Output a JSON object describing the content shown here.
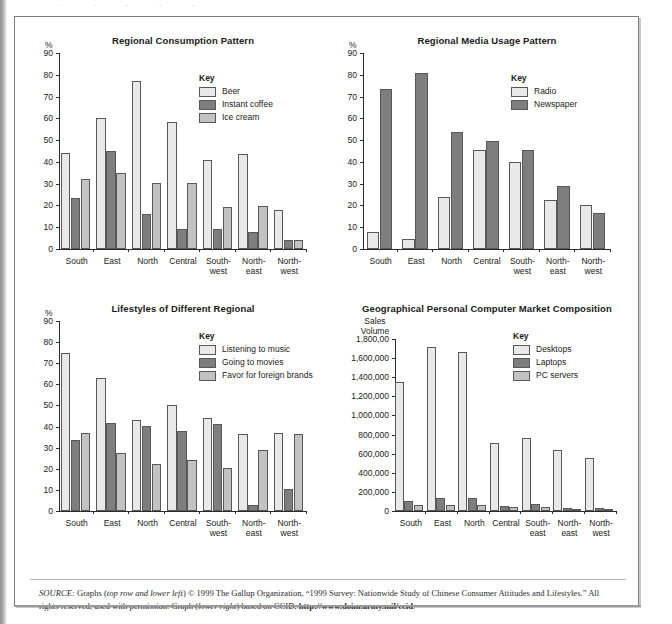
{
  "colors": {
    "series_light": "#e9e9e9",
    "series_dark": "#7e7e7e",
    "series_medium": "#c2c2c2",
    "outline": "#585858",
    "axis": "#2b2b2b",
    "frame": "#7d7d7d"
  },
  "key_title": "Key",
  "source_note": {
    "label": "SOURCE:",
    "part1": " Graphs (",
    "em1": "top row and lower left",
    "part2": ") © 1999 The Gallup Organization, “1999 Survey: Nationwide Study of Chinese Consumer Attitudes and Lifestyles.” All rights reserved, used with permission. Graph (",
    "em2": "lower right",
    "part3": ") based on CCID, ",
    "url": "http://www.doim.army.mil/ccid",
    "part4": "."
  },
  "chart_data": [
    {
      "id": "regional-consumption-pattern",
      "type": "bar",
      "title": "Regional Consumption Pattern",
      "position": "top-left",
      "ylabel": "%",
      "xlabel": "",
      "ylim": [
        0,
        90
      ],
      "yticks": [
        0,
        10,
        20,
        30,
        40,
        50,
        60,
        70,
        80,
        90
      ],
      "ytick_labels": [
        "0",
        "10",
        "20",
        "30",
        "40",
        "50",
        "60",
        "70",
        "80",
        "90"
      ],
      "grid": false,
      "legend_position": "inside-top-right",
      "categories": [
        "South",
        "East",
        "North",
        "Central",
        "South-west",
        "Northeast",
        "North-west"
      ],
      "category_lines": [
        [
          "South"
        ],
        [
          "East"
        ],
        [
          "North"
        ],
        [
          "Central"
        ],
        [
          "South-",
          "west"
        ],
        [
          "North-",
          "east"
        ],
        [
          "North-",
          "west"
        ]
      ],
      "series": [
        {
          "name": "Beer",
          "color": "#e9e9e9",
          "values": [
            44,
            60,
            77,
            58.5,
            41,
            43.5,
            18
          ]
        },
        {
          "name": "Instant coffee",
          "color": "#7e7e7e",
          "values": [
            23.5,
            44.8,
            16,
            9.3,
            9.2,
            7.8,
            4
          ]
        },
        {
          "name": "Ice cream",
          "color": "#c2c2c2",
          "values": [
            32,
            34.8,
            30.2,
            30.1,
            19.2,
            19.6,
            4.1
          ]
        }
      ]
    },
    {
      "id": "regional-media-usage-pattern",
      "type": "bar",
      "title": "Regional Media Usage Pattern",
      "position": "top-right",
      "ylabel": "%",
      "xlabel": "",
      "ylim": [
        0,
        90
      ],
      "yticks": [
        0,
        10,
        20,
        30,
        40,
        50,
        60,
        70,
        80,
        90
      ],
      "ytick_labels": [
        "0",
        "10",
        "20",
        "30",
        "40",
        "50",
        "60",
        "70",
        "80",
        "90"
      ],
      "grid": false,
      "legend_position": "inside-top-right",
      "categories": [
        "South",
        "East",
        "North",
        "Central",
        "Southwest",
        "Northeast",
        "Northwest"
      ],
      "category_lines": [
        [
          "South"
        ],
        [
          "East"
        ],
        [
          "North"
        ],
        [
          "Central"
        ],
        [
          "South-",
          "west"
        ],
        [
          "North-",
          "east"
        ],
        [
          "North-",
          "west"
        ]
      ],
      "series": [
        {
          "name": "Radio",
          "color": "#e9e9e9",
          "values": [
            7.9,
            4.6,
            24,
            45.5,
            39.8,
            22.5,
            20
          ]
        },
        {
          "name": "Newspaper",
          "color": "#7e7e7e",
          "values": [
            73.5,
            80.6,
            53.8,
            49.8,
            45.3,
            28.9,
            16.6
          ]
        }
      ]
    },
    {
      "id": "lifestyles-of-different-regional",
      "type": "bar",
      "title": "Lifestyles of Different Regional",
      "position": "bottom-left",
      "ylabel": "%",
      "xlabel": "",
      "ylim": [
        0,
        90
      ],
      "yticks": [
        0,
        10,
        20,
        30,
        40,
        50,
        60,
        70,
        80,
        90
      ],
      "ytick_labels": [
        "0",
        "10",
        "20",
        "30",
        "40",
        "50",
        "60",
        "70",
        "80",
        "90"
      ],
      "grid": false,
      "legend_position": "inside-top-right",
      "categories": [
        "South",
        "East",
        "North",
        "Central",
        "Southwest",
        "Northeast",
        "Northwest"
      ],
      "category_lines": [
        [
          "South"
        ],
        [
          "East"
        ],
        [
          "North"
        ],
        [
          "Central"
        ],
        [
          "South-",
          "west"
        ],
        [
          "North-",
          "east"
        ],
        [
          "North-",
          "west"
        ]
      ],
      "series": [
        {
          "name": "Listening to music",
          "color": "#e9e9e9",
          "values": [
            75,
            63.2,
            43,
            50.3,
            44,
            36.4,
            37
          ]
        },
        {
          "name": "Going to movies",
          "color": "#7e7e7e",
          "values": [
            33.6,
            41.5,
            40.4,
            37.7,
            41.2,
            2.7,
            10.4
          ]
        },
        {
          "name": "Favor for foreign brands",
          "color": "#c2c2c2",
          "values": [
            36.8,
            27.7,
            22.5,
            24.3,
            20.3,
            29,
            36.5
          ]
        }
      ]
    },
    {
      "id": "geographical-pc-market-composition",
      "type": "bar",
      "title": "Geographical Personal Computer Market Composition",
      "position": "bottom-right",
      "ylabel": "Sales Volume",
      "ylabel_lines": [
        "Sales",
        "Volume"
      ],
      "xlabel": "",
      "ylim": [
        0,
        1800000
      ],
      "yticks": [
        0,
        200000,
        400000,
        600000,
        800000,
        1000000,
        1200000,
        1400000,
        1600000,
        1800000
      ],
      "ytick_labels": [
        "0",
        "200,000",
        "400,000",
        "600,000",
        "800,000",
        "1,000,000",
        "1,200,000",
        "1,400,000",
        "1,600,000",
        "1,800,00"
      ],
      "grid": false,
      "legend_position": "inside-top-right",
      "categories": [
        "South",
        "East",
        "North",
        "Central",
        "Southeast",
        "Northeast",
        "Northwest"
      ],
      "category_lines": [
        [
          "South"
        ],
        [
          "East"
        ],
        [
          "North"
        ],
        [
          "Central"
        ],
        [
          "South-",
          "east"
        ],
        [
          "North-",
          "east"
        ],
        [
          "North-",
          "west"
        ]
      ],
      "series": [
        {
          "name": "Desktops",
          "color": "#e9e9e9",
          "values": [
            1350000,
            1720000,
            1660000,
            710000,
            760000,
            640000,
            560000
          ]
        },
        {
          "name": "Laptops",
          "color": "#7e7e7e",
          "values": [
            105000,
            135000,
            135000,
            55000,
            72000,
            30000,
            28000
          ]
        },
        {
          "name": "PC servers",
          "color": "#c2c2c2",
          "values": [
            60000,
            58000,
            58000,
            45000,
            42000,
            20000,
            18000
          ]
        }
      ]
    }
  ]
}
